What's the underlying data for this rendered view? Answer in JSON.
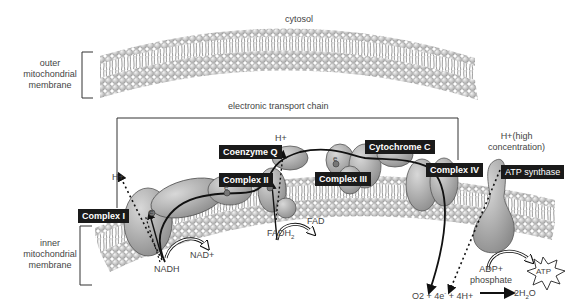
{
  "diagram": {
    "regions": {
      "cytosol": "cytosol",
      "outer_membrane": [
        "outer",
        "mitochondrial",
        "membrane"
      ],
      "inner_membrane": [
        "inner",
        "mitochondrial",
        "membrane"
      ],
      "etc_title": "electronic transport chain"
    },
    "complexes": {
      "complex_1": "Complex I",
      "complex_2": "Complex II",
      "coenzyme_q": "Coenzyme Q",
      "complex_3": "Complex III",
      "cytochrome_c": "Cytochrome C",
      "complex_4": "Complex IV",
      "atp_synthase": "ATP synthase"
    },
    "molecules": {
      "h_plus_left": "H+",
      "h_plus_coq": "H+",
      "h_plus_high": [
        "H+(high",
        "concentration)"
      ],
      "nadh": "NADH",
      "nad_plus": "NAD+",
      "fadh2": "FADH",
      "fadh2_sub": "2",
      "fad": "FAD",
      "electron": "e",
      "adp": [
        "ADP+",
        "phosphate"
      ],
      "atp": "ATP",
      "reaction_left": "O2 + 4e",
      "reaction_sup": "-",
      "reaction_mid": " + 4H+",
      "reaction_product": "2H",
      "reaction_product_sub": "2",
      "reaction_product_end": "O"
    },
    "colors": {
      "label_bg": "#1a1a1a",
      "protein_fill": "#a8a8a8",
      "lipid_head": "#cfcfcf",
      "line": "#222222"
    }
  }
}
